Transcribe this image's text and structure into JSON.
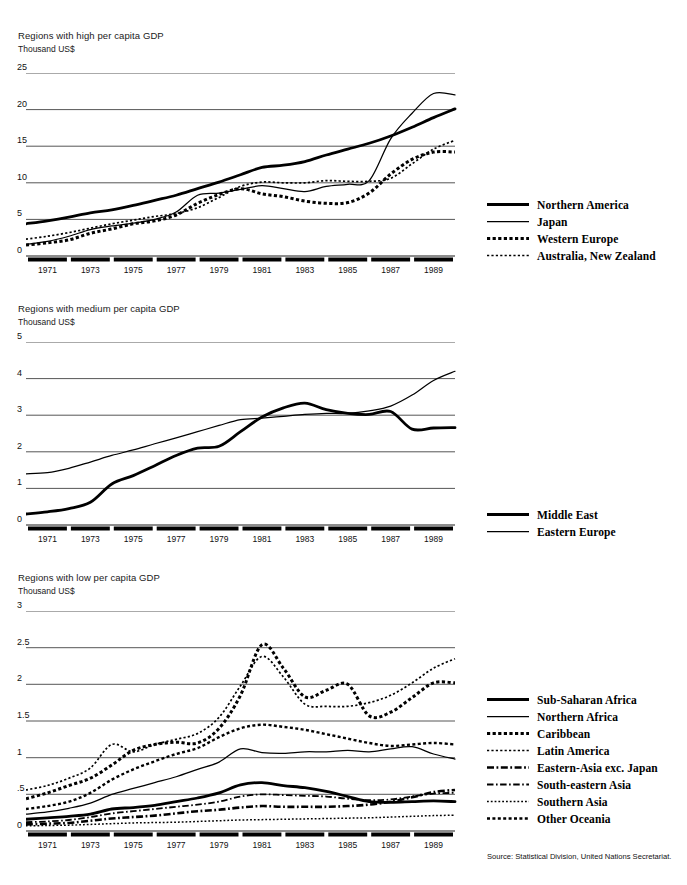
{
  "source_note": "Source: Statistical Division, United Nations Secretariat.",
  "charts": [
    {
      "id": "high",
      "title": "Regions with high per capita GDP",
      "unit": "Thousand US$",
      "chart_data": {
        "type": "line",
        "title": "Regions with high per capita GDP",
        "ylabel": "Thousand US$",
        "xlabel": "",
        "ylim": [
          0,
          25
        ],
        "yticks": [
          0,
          5,
          10,
          15,
          20,
          25
        ],
        "ytick_labels": [
          "0",
          "5",
          "10",
          "15",
          "20",
          "25"
        ],
        "xlim": [
          1970,
          1990
        ],
        "xticks": [
          1971,
          1973,
          1975,
          1977,
          1979,
          1981,
          1983,
          1985,
          1987,
          1989
        ],
        "xtick_labels": [
          "1971",
          "1973",
          "1975",
          "1977",
          "1979",
          "1981",
          "1983",
          "1985",
          "1987",
          "1989"
        ],
        "grid": true,
        "legend_position": "right",
        "x": [
          1970,
          1971,
          1972,
          1973,
          1974,
          1975,
          1976,
          1977,
          1978,
          1979,
          1980,
          1981,
          1982,
          1983,
          1984,
          1985,
          1986,
          1987,
          1988,
          1989,
          1990
        ],
        "series": [
          {
            "name": "Northern America",
            "style": "solid-thick",
            "values": [
              4.4,
              4.8,
              5.3,
              5.9,
              6.3,
              6.9,
              7.6,
              8.3,
              9.2,
              10.1,
              11.1,
              12.1,
              12.4,
              12.9,
              13.8,
              14.6,
              15.4,
              16.4,
              17.6,
              18.9,
              20.1
            ]
          },
          {
            "name": "Japan",
            "style": "solid-thin",
            "values": [
              1.6,
              2.0,
              2.7,
              3.6,
              4.1,
              4.5,
              5.0,
              6.0,
              8.3,
              8.6,
              9.1,
              9.6,
              9.2,
              8.8,
              9.5,
              9.8,
              10.3,
              16.0,
              19.5,
              22.2,
              22.0
            ]
          },
          {
            "name": "Western Europe",
            "style": "dotted-thick",
            "values": [
              1.5,
              1.8,
              2.2,
              3.1,
              3.7,
              4.4,
              4.8,
              5.6,
              7.2,
              8.4,
              9.2,
              8.5,
              8.1,
              7.5,
              7.2,
              7.3,
              8.6,
              11.2,
              13.2,
              14.2,
              14.2
            ]
          },
          {
            "name": "Australia, New Zealand",
            "style": "dotted-thin",
            "values": [
              2.3,
              2.7,
              3.2,
              3.8,
              4.4,
              4.9,
              5.4,
              5.8,
              6.6,
              8.0,
              9.5,
              10.1,
              10.0,
              10.0,
              10.3,
              10.2,
              10.2,
              10.6,
              12.6,
              14.6,
              15.8
            ]
          }
        ]
      }
    },
    {
      "id": "medium",
      "title": "Regions with medium per capita GDP",
      "unit": "Thousand US$",
      "chart_data": {
        "type": "line",
        "title": "Regions with medium per capita GDP",
        "ylabel": "Thousand US$",
        "xlabel": "",
        "ylim": [
          0,
          5
        ],
        "yticks": [
          0,
          1,
          2,
          3,
          4,
          5
        ],
        "ytick_labels": [
          "0",
          "1",
          "2",
          "3",
          "4",
          "5"
        ],
        "xlim": [
          1970,
          1990
        ],
        "xticks": [
          1971,
          1973,
          1975,
          1977,
          1979,
          1981,
          1983,
          1985,
          1987,
          1989
        ],
        "xtick_labels": [
          "1971",
          "1973",
          "1975",
          "1977",
          "1979",
          "1981",
          "1983",
          "1985",
          "1987",
          "1989"
        ],
        "grid": true,
        "legend_position": "right",
        "x": [
          1970,
          1971,
          1972,
          1973,
          1974,
          1975,
          1976,
          1977,
          1978,
          1979,
          1980,
          1981,
          1982,
          1983,
          1984,
          1985,
          1986,
          1987,
          1988,
          1989,
          1990
        ],
        "series": [
          {
            "name": "Middle East",
            "style": "solid-thick",
            "values": [
              0.3,
              0.36,
              0.45,
              0.62,
              1.12,
              1.35,
              1.62,
              1.9,
              2.1,
              2.15,
              2.55,
              2.95,
              3.2,
              3.33,
              3.15,
              3.05,
              3.02,
              3.1,
              2.62,
              2.65,
              2.66
            ]
          },
          {
            "name": "Eastern Europe",
            "style": "solid-thin",
            "values": [
              1.4,
              1.43,
              1.55,
              1.72,
              1.9,
              2.05,
              2.22,
              2.38,
              2.55,
              2.72,
              2.88,
              2.92,
              2.97,
              3.02,
              3.05,
              3.05,
              3.12,
              3.25,
              3.55,
              3.95,
              4.2
            ]
          }
        ]
      }
    },
    {
      "id": "low",
      "title": "Regions with low per capita GDP",
      "unit": "Thousand US$",
      "chart_data": {
        "type": "line",
        "title": "Regions with low per capita GDP",
        "ylabel": "Thousand US$",
        "xlabel": "",
        "ylim": [
          0,
          3
        ],
        "yticks": [
          0,
          0.5,
          1,
          1.5,
          2,
          2.5,
          3
        ],
        "ytick_labels": [
          "0",
          ".5",
          "1",
          "1.5",
          "2",
          "2.5",
          "3"
        ],
        "xlim": [
          1970,
          1990
        ],
        "xticks": [
          1971,
          1973,
          1975,
          1977,
          1979,
          1981,
          1983,
          1985,
          1987,
          1989
        ],
        "xtick_labels": [
          "1971",
          "1973",
          "1975",
          "1977",
          "1979",
          "1981",
          "1983",
          "1985",
          "1987",
          "1989"
        ],
        "grid": true,
        "legend_position": "right",
        "x": [
          1970,
          1971,
          1972,
          1973,
          1974,
          1975,
          1976,
          1977,
          1978,
          1979,
          1980,
          1981,
          1982,
          1983,
          1984,
          1985,
          1986,
          1987,
          1988,
          1989,
          1990
        ],
        "series": [
          {
            "name": "Sub-Saharan Africa",
            "style": "solid-thick",
            "values": [
              0.16,
              0.18,
              0.2,
              0.23,
              0.3,
              0.32,
              0.35,
              0.4,
              0.45,
              0.52,
              0.63,
              0.66,
              0.62,
              0.59,
              0.54,
              0.47,
              0.4,
              0.39,
              0.4,
              0.41,
              0.4
            ]
          },
          {
            "name": "Northern Africa",
            "style": "solid-thin",
            "values": [
              0.23,
              0.26,
              0.31,
              0.38,
              0.5,
              0.58,
              0.66,
              0.74,
              0.84,
              0.94,
              1.12,
              1.07,
              1.06,
              1.08,
              1.08,
              1.1,
              1.08,
              1.12,
              1.15,
              1.05,
              0.98
            ]
          },
          {
            "name": "Caribbean",
            "style": "dotted-thick",
            "values": [
              0.44,
              0.52,
              0.62,
              0.72,
              0.9,
              1.1,
              1.18,
              1.21,
              1.2,
              1.4,
              1.85,
              2.54,
              2.22,
              1.83,
              1.92,
              2.0,
              1.57,
              1.62,
              1.82,
              2.02,
              2.02
            ]
          },
          {
            "name": "Latin America",
            "style": "dotted-thin",
            "values": [
              0.56,
              0.62,
              0.72,
              0.86,
              1.18,
              1.08,
              1.18,
              1.25,
              1.33,
              1.55,
              1.98,
              2.38,
              2.1,
              1.73,
              1.7,
              1.7,
              1.75,
              1.85,
              2.02,
              2.22,
              2.35
            ]
          },
          {
            "name": "Eastern-Asia exc. Japan",
            "style": "dashdot-thick",
            "values": [
              0.09,
              0.1,
              0.11,
              0.14,
              0.17,
              0.19,
              0.21,
              0.24,
              0.27,
              0.29,
              0.32,
              0.34,
              0.33,
              0.33,
              0.33,
              0.34,
              0.36,
              0.4,
              0.46,
              0.53,
              0.56
            ]
          },
          {
            "name": "South-eastern Asia",
            "style": "dashdot-thin",
            "values": [
              0.12,
              0.13,
              0.15,
              0.19,
              0.24,
              0.27,
              0.3,
              0.33,
              0.36,
              0.4,
              0.47,
              0.5,
              0.49,
              0.48,
              0.47,
              0.44,
              0.42,
              0.43,
              0.47,
              0.51,
              0.52
            ]
          },
          {
            "name": "Southern Asia",
            "style": "dotted-fine",
            "values": [
              0.07,
              0.075,
              0.08,
              0.09,
              0.1,
              0.11,
              0.115,
              0.12,
              0.13,
              0.14,
              0.15,
              0.155,
              0.16,
              0.165,
              0.17,
              0.175,
              0.18,
              0.19,
              0.2,
              0.21,
              0.215
            ]
          },
          {
            "name": "Other Oceania",
            "style": "dotted-thick2",
            "values": [
              0.3,
              0.34,
              0.4,
              0.52,
              0.7,
              0.84,
              0.95,
              1.05,
              1.13,
              1.28,
              1.4,
              1.45,
              1.42,
              1.38,
              1.32,
              1.26,
              1.2,
              1.16,
              1.18,
              1.2,
              1.18
            ]
          }
        ]
      }
    }
  ]
}
